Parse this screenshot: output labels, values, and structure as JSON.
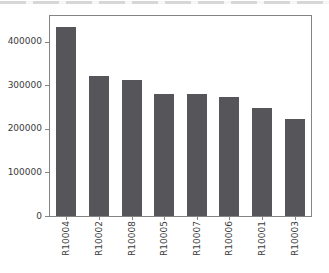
{
  "page": {
    "background": "#ffffff",
    "top_strip_color": "#d7d7d7"
  },
  "chart_data": {
    "type": "bar",
    "title": "",
    "xlabel": "",
    "ylabel": "",
    "categories": [
      "R10004",
      "R10002",
      "R10008",
      "R10005",
      "R10007",
      "R10006",
      "R10001",
      "R10003"
    ],
    "values": [
      433000,
      322000,
      313000,
      280000,
      279000,
      273000,
      247000,
      223000
    ],
    "yticks": [
      0,
      100000,
      200000,
      300000,
      400000
    ],
    "ytick_labels": [
      "0",
      "100000",
      "200000",
      "300000",
      "400000"
    ],
    "ylim": [
      0,
      459000
    ],
    "x_tick_rotation": 90,
    "grid": false,
    "legend_position": "none",
    "bar_color": "#56565a",
    "axis_color": "#848484",
    "tick_label_color": "#3b3b3b"
  }
}
